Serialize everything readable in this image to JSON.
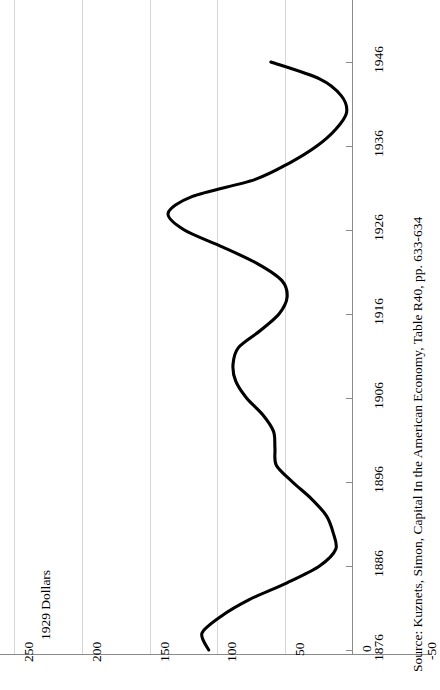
{
  "chart_data": {
    "type": "line",
    "title": "",
    "xlabel": "",
    "ylabel": "1929 Dollars",
    "orientation": "rotated-90-ccw",
    "grid": true,
    "legend": "none",
    "xlim": [
      1876,
      1946
    ],
    "ylim": [
      -50,
      250
    ],
    "x_tick_labels": [
      "1876",
      "1886",
      "1896",
      "1906",
      "1916",
      "1926",
      "1936",
      "1946"
    ],
    "x_ticks": [
      1876,
      1886,
      1896,
      1906,
      1916,
      1926,
      1936,
      1946
    ],
    "y_tick_labels": [
      "250",
      "200",
      "150",
      "100",
      "50",
      "0",
      "-50"
    ],
    "y_ticks": [
      250,
      200,
      150,
      100,
      50,
      0,
      -50
    ],
    "series": [
      {
        "name": "Capital stock (1929 dollars)",
        "x": [
          1876,
          1878,
          1880,
          1882,
          1884,
          1886,
          1888,
          1890,
          1892,
          1894,
          1896,
          1898,
          1900,
          1902,
          1904,
          1906,
          1908,
          1910,
          1912,
          1914,
          1916,
          1918,
          1920,
          1922,
          1924,
          1926,
          1928,
          1930,
          1932,
          1934,
          1936,
          1938,
          1940,
          1942,
          1944,
          1946
        ],
        "values": [
          106,
          111,
          97,
          76,
          48,
          24,
          12,
          14,
          19,
          30,
          44,
          56,
          57,
          58,
          66,
          78,
          86,
          88,
          84,
          68,
          54,
          48,
          52,
          70,
          96,
          124,
          136,
          118,
          72,
          46,
          26,
          12,
          4,
          8,
          24,
          60
        ]
      }
    ],
    "source_note": "Source: Kuznets, Simon, Capital In the American Economy, Table R40, pp. 633-634"
  },
  "axis_title": "1929 Dollars",
  "source": "Source: Kuznets, Simon, Capital In the American Economy, Table R40, pp. 633-634",
  "value_labels": [
    "250",
    "200",
    "150",
    "100",
    "50",
    "0",
    "-50"
  ],
  "year_labels": [
    "1876",
    "1886",
    "1896",
    "1906",
    "1916",
    "1926",
    "1936",
    "1946"
  ]
}
